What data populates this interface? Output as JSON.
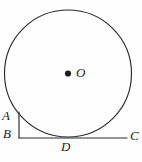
{
  "figure": {
    "kind": "geometry-diagram",
    "width": 142,
    "height": 162,
    "background_color": "#fefefe",
    "stroke_color": "#2b2b2b",
    "label_color": "#232323"
  },
  "circle": {
    "center_x": 68,
    "center_y": 73.5,
    "radius": 63.5,
    "center_dot_radius": 3.1
  },
  "segments": {
    "ab": {
      "name": "segment-AB",
      "x1": 19,
      "y1": 112,
      "x2": 19,
      "y2": 138
    },
    "bc": {
      "name": "segment-BC",
      "x1": 19,
      "y1": 138,
      "x2": 127,
      "y2": 138
    }
  },
  "labels": {
    "a": {
      "text": "A",
      "x": 2,
      "y": 109
    },
    "b": {
      "text": "B",
      "x": 3,
      "y": 127
    },
    "c": {
      "text": "C",
      "x": 130,
      "y": 129
    },
    "d": {
      "text": "D",
      "x": 61,
      "y": 140
    },
    "o": {
      "text": "O",
      "x": 76,
      "y": 66
    }
  },
  "points": {
    "a": {
      "label": "A",
      "x": 19,
      "y": 112
    },
    "b": {
      "label": "B",
      "x": 19,
      "y": 138
    },
    "c": {
      "label": "C",
      "x": 127,
      "y": 138
    },
    "d": {
      "label": "D",
      "x": 68,
      "y": 137
    },
    "o": {
      "label": "O",
      "x": 68,
      "y": 73.5
    }
  }
}
